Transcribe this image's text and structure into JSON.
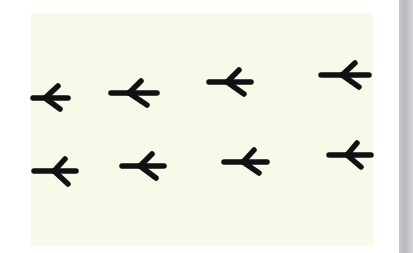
{
  "image": {
    "description": "Two rows of bird footprints on a pale background, all pointing left",
    "colors": {
      "background": "#ffffff",
      "panel": "#f6fbe9",
      "ink": "#111111",
      "gutter": "#bdbdc0"
    },
    "icon": "bird-footprint",
    "rows": [
      {
        "name": "top-row",
        "tracks": [
          {
            "shaft": [
              33,
              98,
              68,
              98
            ],
            "junction": [
              45,
              98
            ],
            "toe_up": [
              58,
              86
            ],
            "toe_down": [
              60,
              109
            ]
          },
          {
            "shaft": [
              111,
              93,
              157,
              93
            ],
            "junction": [
              129,
              93
            ],
            "toe_up": [
              141,
              81
            ],
            "toe_down": [
              147,
              105
            ]
          },
          {
            "shaft": [
              209,
              82,
              251,
              82
            ],
            "junction": [
              227,
              82
            ],
            "toe_up": [
              239,
              70
            ],
            "toe_down": [
              244,
              94
            ]
          },
          {
            "shaft": [
              321,
              75,
              369,
              75
            ],
            "junction": [
              342,
              75
            ],
            "toe_up": [
              355,
              63
            ],
            "toe_down": [
              359,
              87
            ]
          }
        ]
      },
      {
        "name": "bottom-row",
        "tracks": [
          {
            "shaft": [
              34,
              171,
              76,
              171
            ],
            "junction": [
              54,
              171
            ],
            "toe_up": [
              65,
              159
            ],
            "toe_down": [
              68,
              184
            ]
          },
          {
            "shaft": [
              122,
              166,
              164,
              166
            ],
            "junction": [
              140,
              166
            ],
            "toe_up": [
              152,
              154
            ],
            "toe_down": [
              156,
              178
            ]
          },
          {
            "shaft": [
              224,
              162,
              267,
              162
            ],
            "junction": [
              243,
              162
            ],
            "toe_up": [
              254,
              150
            ],
            "toe_down": [
              259,
              173
            ]
          },
          {
            "shaft": [
              329,
              155,
              371,
              155
            ],
            "junction": [
              347,
              155
            ],
            "toe_up": [
              357,
              143
            ],
            "toe_down": [
              361,
              167
            ]
          }
        ]
      }
    ]
  }
}
